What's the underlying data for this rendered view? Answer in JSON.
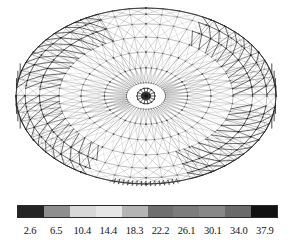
{
  "figure": {
    "kind": "finite-element-mesh-contour-plot"
  },
  "chart_data": {
    "type": "heatmap",
    "title": "",
    "subtitle": "",
    "xlabel": "",
    "ylabel": "",
    "grid": false,
    "legend_position": "bottom",
    "colormap": "grayscale-discrete",
    "colorbar": {
      "orientation": "horizontal",
      "segment_count": 10,
      "tick_labels": [
        "2.6",
        "6.5",
        "10.4",
        "14.4",
        "18.3",
        "22.2",
        "26.1",
        "30.1",
        "34.0",
        "37.9"
      ],
      "values": [
        2.6,
        6.5,
        10.4,
        14.4,
        18.3,
        22.2,
        26.1,
        30.1,
        34.0,
        37.9
      ],
      "range": [
        2.6,
        37.9
      ],
      "segment_colors": [
        "#242424",
        "#8e8e8e",
        "#d8d8d8",
        "#e6e6e6",
        "#b4b4b4",
        "#6f6f6f",
        "#7c7c7c",
        "#888888",
        "#6a6a6a",
        "#121212"
      ]
    },
    "mesh": {
      "shape": "ellipse",
      "center_x": 146,
      "center_y": 96,
      "radius_x": 130,
      "radius_y": 88,
      "ring_count": 7,
      "radial_count": 48,
      "ring_scales": [
        1.0,
        0.93,
        0.82,
        0.67,
        0.5,
        0.32,
        0.15
      ],
      "hub_radius": 9,
      "line_color": "#3a3a3a",
      "accent_color": "#111111"
    }
  }
}
